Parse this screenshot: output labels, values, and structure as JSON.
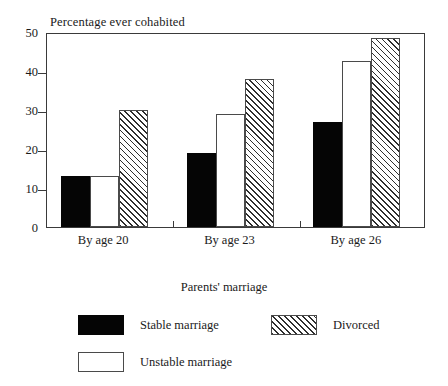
{
  "chart_data": {
    "type": "bar",
    "title": "Percentage ever cohabited",
    "xlabel": "",
    "ylabel": "",
    "ylim": [
      0,
      50
    ],
    "yticks": [
      0,
      10,
      20,
      30,
      40,
      50
    ],
    "grid": false,
    "legend_position": "below-plot",
    "legend_title": "Parents' marriage",
    "categories": [
      "By age 20",
      "By age 23",
      "By age 26"
    ],
    "series": [
      {
        "name": "Stable marriage",
        "style": "solid-black",
        "values": [
          13,
          19,
          27
        ]
      },
      {
        "name": "Unstable marriage",
        "style": "open-white",
        "values": [
          13,
          29,
          42.5
        ]
      },
      {
        "name": "Divorced",
        "style": "diagonal-hatch",
        "values": [
          30,
          38,
          48.5
        ]
      }
    ]
  },
  "axis": {
    "y_tick_labels": [
      "0",
      "10",
      "20",
      "30",
      "40",
      "50"
    ]
  },
  "legend": {
    "title": "Parents' marriage",
    "items": [
      {
        "label": "Stable marriage",
        "style": "solid"
      },
      {
        "label": "Divorced",
        "style": "hatch"
      },
      {
        "label": "Unstable marriage",
        "style": "open"
      }
    ]
  },
  "colors": {
    "solid_fill": "#050505",
    "open_fill": "#ffffff",
    "hatch_line": "#2e2e2e",
    "axis": "#3a3a3a",
    "text": "#1a1a1a",
    "background": "#ffffff"
  }
}
